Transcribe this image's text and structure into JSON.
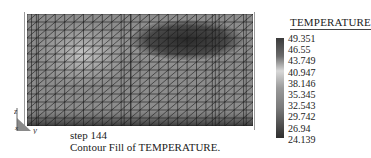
{
  "chart_data": {
    "type": "heatmap",
    "title": "TEMPERATURE",
    "subtitle": "step 144",
    "caption": "Contour Fill of TEMPERATURE.",
    "colorscale": "grayscale",
    "legend": {
      "title": "TEMPERATURE",
      "position": "right",
      "ticks": [
        "49.351",
        "46.55",
        "43.749",
        "40.947",
        "38.146",
        "35.345",
        "32.543",
        "29.742",
        "26.94",
        "24.139"
      ],
      "max": 49.351,
      "min": 24.139
    },
    "axes": {
      "triad": [
        "z",
        "x",
        "y"
      ]
    },
    "mesh": {
      "cols": 24,
      "rows": 14,
      "element": "triangular"
    },
    "regions": [
      {
        "name": "dark-hot-region",
        "x_range": [
          0.48,
          0.88
        ],
        "y_range": [
          0.08,
          0.4
        ],
        "level": "high"
      },
      {
        "name": "light-left-region",
        "x_range": [
          0.1,
          0.4
        ],
        "y_range": [
          0.15,
          0.55
        ],
        "level": "mid"
      },
      {
        "name": "dark-bottom-band",
        "x_range": [
          0.0,
          1.0
        ],
        "y_range": [
          0.88,
          1.0
        ],
        "level": "high"
      }
    ]
  },
  "figure": {
    "step_label": "step 144",
    "caption": "Contour Fill of TEMPERATURE.",
    "axis_z": "z",
    "axis_x": "x",
    "axis_y": "y"
  }
}
